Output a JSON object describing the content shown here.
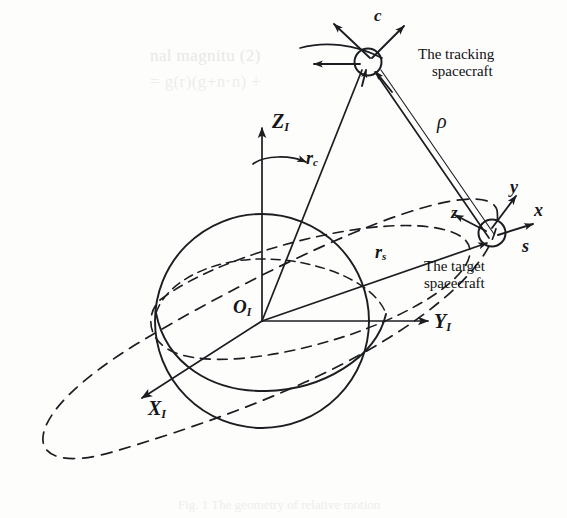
{
  "figure": {
    "domain": "diagram",
    "kind": "orbital-relative-motion-geometry",
    "background_color": "#fdfdfc",
    "ink_color": "#1b1d21"
  },
  "frames": {
    "inertial": {
      "origin_label": "O",
      "origin_sub": "I",
      "axes": [
        {
          "name": "x-axis",
          "label": "X",
          "sub": "I",
          "direction": "down-left"
        },
        {
          "name": "y-axis",
          "label": "Y",
          "sub": "I",
          "direction": "right"
        },
        {
          "name": "z-axis",
          "label": "Z",
          "sub": "I",
          "direction": "up"
        }
      ],
      "spin_arrow": true
    },
    "tracking_body": {
      "label": "c",
      "axes": [
        "up-left",
        "up-right",
        "left"
      ]
    },
    "target_body": {
      "label": "s",
      "axes": [
        {
          "name": "x-axis",
          "label": "x",
          "direction": "right"
        },
        {
          "name": "y-axis",
          "label": "y",
          "direction": "up-right"
        },
        {
          "name": "z-axis",
          "label": "z",
          "direction": "left"
        }
      ]
    }
  },
  "vectors": [
    {
      "name": "tracking-position-vector",
      "label": "r",
      "sub": "c",
      "from": "origin",
      "to": "tracking-spacecraft"
    },
    {
      "name": "target-position-vector",
      "label": "r",
      "sub": "s",
      "from": "origin",
      "to": "target-spacecraft"
    },
    {
      "name": "relative-range-vector",
      "label": "ρ",
      "sub": "",
      "from": "tracking-spacecraft",
      "to": "target-spacecraft"
    }
  ],
  "callouts": {
    "tracking": {
      "line1": "The tracking",
      "line2": "spacecraft"
    },
    "target": {
      "line1": "The target",
      "line2": "spacecraft"
    }
  },
  "bodies": {
    "central_body": {
      "name": "earth-sphere",
      "style": "circle-with-equator"
    },
    "equatorial_plane": {
      "name": "equatorial-plane-ellipse",
      "style": "dashed"
    },
    "orbit": {
      "name": "orbit-ellipse",
      "style": "dashed"
    }
  },
  "bleed_through": {
    "line1": "nal magnitu (2)",
    "line2": "= g(r)(g+n·n) +"
  },
  "caption_faint": "Fig. 1 The geometry of relative motion"
}
